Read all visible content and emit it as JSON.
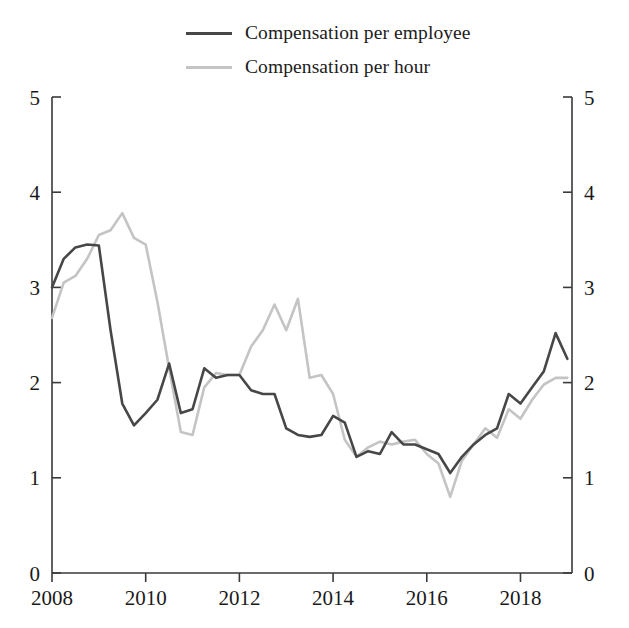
{
  "legend": {
    "position": "top-left",
    "items": [
      {
        "label": "Compensation per employee",
        "color": "#474747"
      },
      {
        "label": "Compensation per hour",
        "color": "#c4c4c4"
      }
    ]
  },
  "axes": {
    "y_left_ticks": [
      "0",
      "1",
      "2",
      "3",
      "4",
      "5"
    ],
    "y_right_ticks": [
      "0",
      "1",
      "2",
      "3",
      "4",
      "5"
    ],
    "x_ticks": [
      "2008",
      "2010",
      "2012",
      "2014",
      "2016",
      "2018"
    ]
  },
  "chart_data": {
    "type": "line",
    "title": "",
    "xlabel": "",
    "ylabel": "",
    "xlim": [
      2008,
      2019.1
    ],
    "ylim": [
      0,
      5
    ],
    "grid": false,
    "legend_position": "top-left",
    "y_axis_both_sides": true,
    "x_tick_values": [
      2008,
      2010,
      2012,
      2014,
      2016,
      2018
    ],
    "y_tick_values": [
      0,
      1,
      2,
      3,
      4,
      5
    ],
    "x": [
      2008.0,
      2008.25,
      2008.5,
      2008.75,
      2009.0,
      2009.25,
      2009.5,
      2009.75,
      2010.0,
      2010.25,
      2010.5,
      2010.75,
      2011.0,
      2011.25,
      2011.5,
      2011.75,
      2012.0,
      2012.25,
      2012.5,
      2012.75,
      2013.0,
      2013.25,
      2013.5,
      2013.75,
      2014.0,
      2014.25,
      2014.5,
      2014.75,
      2015.0,
      2015.25,
      2015.5,
      2015.75,
      2016.0,
      2016.25,
      2016.5,
      2016.75,
      2017.0,
      2017.25,
      2017.5,
      2017.75,
      2018.0,
      2018.25,
      2018.5,
      2018.75,
      2019.0
    ],
    "series": [
      {
        "name": "Compensation per employee",
        "color": "#474747",
        "linewidth": 2.6,
        "values": [
          3.0,
          3.3,
          3.42,
          3.45,
          3.44,
          2.55,
          1.78,
          1.55,
          1.68,
          1.82,
          2.2,
          1.68,
          1.72,
          2.15,
          2.05,
          2.08,
          2.08,
          1.92,
          1.88,
          1.88,
          1.52,
          1.45,
          1.43,
          1.45,
          1.65,
          1.58,
          1.22,
          1.28,
          1.25,
          1.48,
          1.35,
          1.35,
          1.3,
          1.25,
          1.05,
          1.22,
          1.35,
          1.45,
          1.52,
          1.88,
          1.78,
          1.95,
          2.12,
          2.52,
          2.25
        ]
      },
      {
        "name": "Compensation per hour",
        "color": "#c4c4c4",
        "linewidth": 2.6,
        "values": [
          2.68,
          3.05,
          3.12,
          3.3,
          3.55,
          3.6,
          3.78,
          3.52,
          3.45,
          2.85,
          2.15,
          1.48,
          1.45,
          1.95,
          2.1,
          2.08,
          2.08,
          2.38,
          2.55,
          2.82,
          2.55,
          2.88,
          2.05,
          2.08,
          1.88,
          1.4,
          1.22,
          1.32,
          1.38,
          1.35,
          1.38,
          1.4,
          1.25,
          1.15,
          0.8,
          1.18,
          1.35,
          1.52,
          1.42,
          1.72,
          1.62,
          1.82,
          1.98,
          2.05,
          2.05
        ]
      }
    ]
  }
}
